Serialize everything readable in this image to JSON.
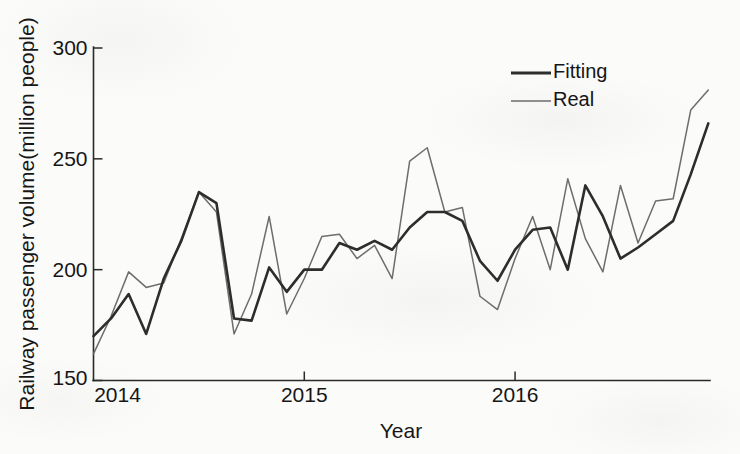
{
  "chart_data": {
    "type": "line",
    "title": "",
    "xlabel": "Year",
    "ylabel": "Railway passenger volume(million people)",
    "ylim": [
      150,
      300
    ],
    "yticks": [
      150,
      200,
      250,
      300
    ],
    "ytick_labels": [
      "150",
      "200",
      "250",
      "300"
    ],
    "xlim": [
      2014.0,
      2016.92
    ],
    "xticks": [
      2014,
      2015,
      2016
    ],
    "xtick_labels": [
      "2014",
      "2015",
      "2016"
    ],
    "grid": false,
    "legend_position": "upper right",
    "x": [
      "2014-01",
      "2014-02",
      "2014-03",
      "2014-04",
      "2014-05",
      "2014-06",
      "2014-07",
      "2014-08",
      "2014-09",
      "2014-10",
      "2014-11",
      "2014-12",
      "2015-01",
      "2015-02",
      "2015-03",
      "2015-04",
      "2015-05",
      "2015-06",
      "2015-07",
      "2015-08",
      "2015-09",
      "2015-10",
      "2015-11",
      "2015-12",
      "2016-01",
      "2016-02",
      "2016-03",
      "2016-04",
      "2016-05",
      "2016-06",
      "2016-07",
      "2016-08",
      "2016-09",
      "2016-10",
      "2016-11",
      "2016-12"
    ],
    "series": [
      {
        "name": "Fitting",
        "color": "#2d2d2d",
        "values": [
          170,
          178,
          189,
          171,
          196,
          213,
          235,
          230,
          178,
          177,
          201,
          190,
          200,
          200,
          212,
          209,
          213,
          209,
          219,
          226,
          226,
          222,
          204,
          195,
          209,
          218,
          219,
          200,
          238,
          224,
          205,
          210,
          216,
          222,
          243,
          266
        ]
      },
      {
        "name": "Real",
        "color": "#6d6d6d",
        "values": [
          162,
          179,
          199,
          192,
          194,
          214,
          235,
          226,
          171,
          189,
          224,
          180,
          196,
          215,
          216,
          205,
          211,
          196,
          249,
          255,
          226,
          228,
          188,
          182,
          205,
          224,
          200,
          241,
          214,
          199,
          238,
          212,
          231,
          232,
          272,
          281
        ]
      }
    ]
  },
  "legend": {
    "entries": [
      {
        "label": "Fitting"
      },
      {
        "label": "Real"
      }
    ]
  },
  "axes": {
    "y_title": "Railway passenger volume(million people)",
    "x_title": "Year"
  }
}
